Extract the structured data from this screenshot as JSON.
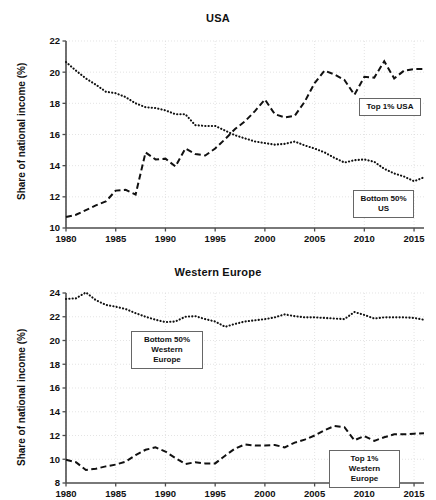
{
  "figure": {
    "width": 436,
    "height": 500,
    "background": "#ffffff",
    "line_color": "#111111",
    "grid_color": "#d8d8d8"
  },
  "charts": [
    {
      "id": "usa",
      "chart_data": {
        "type": "line",
        "title": "USA",
        "xlabel": "",
        "ylabel": "Share of national income (%)",
        "xlim": [
          1980,
          2016
        ],
        "ylim": [
          10,
          22
        ],
        "xticks": [
          1980,
          1985,
          1990,
          1995,
          2000,
          2005,
          2010,
          2015
        ],
        "yticks": [
          10,
          12,
          14,
          16,
          18,
          20,
          22
        ],
        "grid": true,
        "legend": "annotations",
        "x": [
          1980,
          1981,
          1982,
          1983,
          1984,
          1985,
          1986,
          1987,
          1988,
          1989,
          1990,
          1991,
          1992,
          1993,
          1994,
          1995,
          1996,
          1997,
          1998,
          1999,
          2000,
          2001,
          2002,
          2003,
          2004,
          2005,
          2006,
          2007,
          2008,
          2009,
          2010,
          2011,
          2012,
          2013,
          2014,
          2015,
          2016
        ],
        "series": [
          {
            "name": "Bottom 50% US",
            "style": "dotted",
            "values": [
              20.65,
              20.1,
              19.6,
              19.2,
              18.75,
              18.65,
              18.4,
              18.0,
              17.75,
              17.7,
              17.55,
              17.3,
              17.3,
              16.6,
              16.55,
              16.55,
              16.25,
              15.95,
              15.75,
              15.55,
              15.45,
              15.35,
              15.4,
              15.55,
              15.3,
              15.1,
              14.85,
              14.5,
              14.2,
              14.35,
              14.4,
              14.25,
              13.8,
              13.5,
              13.3,
              13.0,
              13.25,
              13.2,
              13.15
            ]
          },
          {
            "name": "Top 1% USA",
            "style": "dashed",
            "values": [
              10.7,
              10.85,
              11.15,
              11.45,
              11.7,
              12.4,
              12.45,
              12.15,
              14.85,
              14.4,
              14.45,
              13.95,
              15.1,
              14.75,
              14.65,
              15.1,
              15.7,
              16.35,
              16.85,
              17.5,
              18.25,
              17.3,
              17.1,
              17.2,
              18.1,
              19.3,
              20.1,
              19.85,
              19.5,
              18.55,
              19.7,
              19.65,
              20.7,
              19.6,
              20.1,
              20.2,
              20.2
            ]
          }
        ],
        "annotations": [
          {
            "text": "Top 1% USA",
            "x_px": 359,
            "y_px": 98,
            "w_px": 62,
            "h_px": 16
          },
          {
            "text": "Bottom 50%\nUS",
            "x_px": 353,
            "y_px": 190,
            "w_px": 61,
            "h_px": 28
          }
        ]
      }
    },
    {
      "id": "western-europe",
      "chart_data": {
        "type": "line",
        "title": "Western Europe",
        "xlabel": "",
        "ylabel": "Share of national income (%)",
        "xlim": [
          1980,
          2016
        ],
        "ylim": [
          8,
          24
        ],
        "xticks": [
          1980,
          1985,
          1990,
          1995,
          2000,
          2005,
          2010,
          2015
        ],
        "yticks": [
          8,
          10,
          12,
          14,
          16,
          18,
          20,
          22,
          24
        ],
        "grid": true,
        "legend": "annotations",
        "x": [
          1980,
          1981,
          1982,
          1983,
          1984,
          1985,
          1986,
          1987,
          1988,
          1989,
          1990,
          1991,
          1992,
          1993,
          1994,
          1995,
          1996,
          1997,
          1998,
          1999,
          2000,
          2001,
          2002,
          2003,
          2004,
          2005,
          2006,
          2007,
          2008,
          2009,
          2010,
          2011,
          2012,
          2013,
          2014,
          2015,
          2016
        ],
        "series": [
          {
            "name": "Bottom 50% Western Europe",
            "style": "dotted",
            "values": [
              23.5,
              23.55,
              24.05,
              23.4,
              23.0,
              22.85,
              22.65,
              22.3,
              22.0,
              21.75,
              21.55,
              21.6,
              22.0,
              22.05,
              21.8,
              21.6,
              21.15,
              21.4,
              21.6,
              21.7,
              21.8,
              21.95,
              22.2,
              22.05,
              21.95,
              21.95,
              21.9,
              21.85,
              21.8,
              22.4,
              22.15,
              21.85,
              21.95,
              21.95,
              21.95,
              21.9,
              21.75
            ]
          },
          {
            "name": "Top 1% Western Europe",
            "style": "dashed",
            "values": [
              9.95,
              9.75,
              9.1,
              9.2,
              9.4,
              9.55,
              9.8,
              10.35,
              10.8,
              11.0,
              10.65,
              10.1,
              9.6,
              9.75,
              9.65,
              9.65,
              10.3,
              10.9,
              11.25,
              11.15,
              11.15,
              11.2,
              11.0,
              11.4,
              11.65,
              12.0,
              12.45,
              12.8,
              12.7,
              11.6,
              11.95,
              11.55,
              11.85,
              12.1,
              12.1,
              12.15,
              12.2
            ]
          }
        ],
        "annotations": [
          {
            "text": "Bottom 50%\nWestern Europe",
            "x_px": 131,
            "y_px": 73,
            "w_px": 72,
            "h_px": 29
          },
          {
            "text": "Top 1%\nWestern Europe",
            "x_px": 329,
            "y_px": 192,
            "w_px": 71,
            "h_px": 29
          }
        ]
      }
    }
  ]
}
